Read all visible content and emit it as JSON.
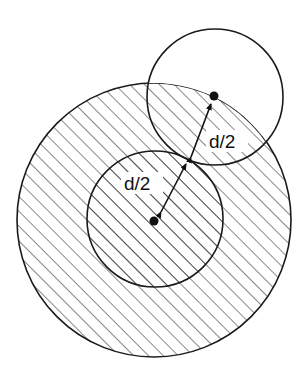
{
  "figure": {
    "colors": {
      "stroke": "#1a1a1a",
      "hatch": "#2a2a2a",
      "background": "#ffffff"
    },
    "outer_circle": {
      "cx": 154,
      "cy": 220,
      "r": 137,
      "hatched": true
    },
    "inner_circle": {
      "cx": 155,
      "cy": 219,
      "r": 68,
      "hatched": true
    },
    "small_circle": {
      "cx": 215,
      "cy": 97,
      "r": 68,
      "hatched": false
    },
    "points": [
      {
        "name": "inner-center",
        "x": 154,
        "y": 221
      },
      {
        "name": "small-center",
        "x": 214,
        "y": 96
      }
    ],
    "labels": {
      "inner_radius": "d/2",
      "small_radius": "d/2"
    },
    "arrows": [
      {
        "name": "inner-radius-arrow",
        "x1": 161,
        "y1": 212,
        "x2": 186,
        "y2": 164
      },
      {
        "name": "small-radius-arrow",
        "x1": 191,
        "y1": 157,
        "x2": 211,
        "y2": 104
      }
    ]
  }
}
